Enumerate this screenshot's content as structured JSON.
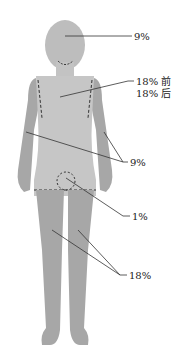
{
  "diagram": {
    "colors": {
      "skin": "#b9b9b9",
      "limb": "#a7a7a7",
      "head": "#bdbdbd",
      "line": "#333333",
      "text": "#222222"
    },
    "labels": {
      "head": "9%",
      "trunk_front": "18% 前",
      "trunk_back": "18% 后",
      "arms": "9%",
      "genitals": "1%",
      "legs": "18%"
    }
  }
}
